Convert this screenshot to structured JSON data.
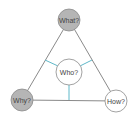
{
  "diagram": {
    "nodes": {
      "what": {
        "label": "What?",
        "fill": "#b5b5b5"
      },
      "why": {
        "label": "Why?",
        "fill": "#b5b5b5"
      },
      "how": {
        "label": "How?",
        "fill": "#ffffff"
      },
      "who": {
        "label": "Who?",
        "fill": "#ffffff"
      }
    },
    "colors": {
      "edge": "#8a8a8a",
      "connector": "#5fb8c9",
      "node_stroke": "#8a8a8a",
      "text": "#444444"
    }
  }
}
